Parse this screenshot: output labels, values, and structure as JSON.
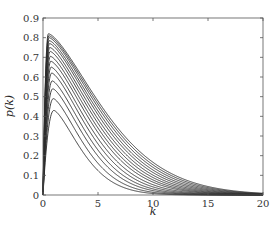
{
  "chart_data": {
    "type": "line",
    "title": "",
    "xlabel": "k",
    "ylabel": "p(k)",
    "xlim": [
      0,
      20
    ],
    "ylim": [
      0,
      0.9
    ],
    "xticks": [
      0,
      5,
      10,
      15,
      20
    ],
    "yticks": [
      0,
      0.1,
      0.2,
      0.3,
      0.4,
      0.5,
      0.6,
      0.7,
      0.8,
      0.9
    ],
    "grid": false,
    "legend": null,
    "line_color": "#2b2b2b",
    "x": [
      0,
      0.25,
      0.5,
      0.75,
      1,
      1.5,
      2,
      3,
      4,
      5,
      6,
      7,
      8,
      9,
      10,
      11,
      12,
      13,
      14,
      15,
      16,
      17,
      18,
      19,
      20
    ],
    "series": [
      {
        "name": "curve-1",
        "peak": 0.43,
        "peak_k": 1.0,
        "scale": 3.2
      },
      {
        "name": "curve-2",
        "peak": 0.49,
        "peak_k": 0.95,
        "scale": 3.5
      },
      {
        "name": "curve-3",
        "peak": 0.54,
        "peak_k": 0.9,
        "scale": 3.8
      },
      {
        "name": "curve-4",
        "peak": 0.58,
        "peak_k": 0.85,
        "scale": 4.05
      },
      {
        "name": "curve-5",
        "peak": 0.62,
        "peak_k": 0.8,
        "scale": 4.3
      },
      {
        "name": "curve-6",
        "peak": 0.65,
        "peak_k": 0.75,
        "scale": 4.55
      },
      {
        "name": "curve-7",
        "peak": 0.68,
        "peak_k": 0.72,
        "scale": 4.8
      },
      {
        "name": "curve-8",
        "peak": 0.705,
        "peak_k": 0.68,
        "scale": 5.0
      },
      {
        "name": "curve-9",
        "peak": 0.73,
        "peak_k": 0.65,
        "scale": 5.2
      },
      {
        "name": "curve-10",
        "peak": 0.75,
        "peak_k": 0.62,
        "scale": 5.4
      },
      {
        "name": "curve-11",
        "peak": 0.77,
        "peak_k": 0.6,
        "scale": 5.6
      },
      {
        "name": "curve-12",
        "peak": 0.785,
        "peak_k": 0.57,
        "scale": 5.8
      },
      {
        "name": "curve-13",
        "peak": 0.8,
        "peak_k": 0.55,
        "scale": 6.0
      },
      {
        "name": "curve-14",
        "peak": 0.81,
        "peak_k": 0.53,
        "scale": 6.2
      },
      {
        "name": "curve-15",
        "peak": 0.82,
        "peak_k": 0.5,
        "scale": 6.4
      }
    ]
  },
  "axes": {
    "x_label": "k",
    "y_label": "p(k)",
    "x_tick_labels": [
      "0",
      "5",
      "10",
      "15",
      "20"
    ],
    "y_tick_labels": [
      "0",
      "0.1",
      "0.2",
      "0.3",
      "0.4",
      "0.5",
      "0.6",
      "0.7",
      "0.8",
      "0.9"
    ]
  }
}
